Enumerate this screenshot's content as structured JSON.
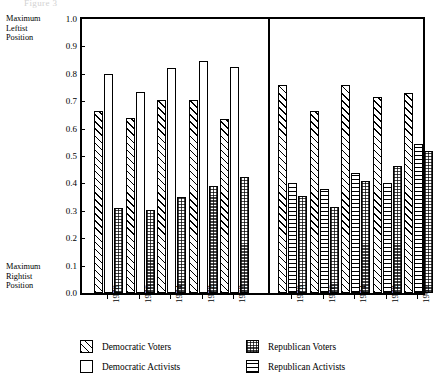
{
  "ghost_caption": "Figure 3",
  "axis": {
    "y_ticks": [
      "1.0",
      "0.9",
      "0.8",
      "0.7",
      "0.6",
      "0.5",
      "0.4",
      "0.3",
      "0.2",
      "0.1",
      "0.0"
    ],
    "y_values": [
      1.0,
      0.9,
      0.8,
      0.7,
      0.6,
      0.5,
      0.4,
      0.3,
      0.2,
      0.1,
      0.0
    ],
    "ylim": [
      0.0,
      1.0
    ],
    "top_note_lines": [
      "Maximum",
      "Leftist",
      "Position"
    ],
    "bottom_note_lines": [
      "Maximum",
      "Rightist",
      "Position"
    ]
  },
  "panels": [
    {
      "title": "Democratic  Ideological  Space"
    },
    {
      "title": "Republican  Ideological  Space"
    }
  ],
  "legend": [
    {
      "label": "Democratic Voters",
      "pattern": "diagonal-hatch"
    },
    {
      "label": "Democratic Activists",
      "pattern": "open-white"
    },
    {
      "label": "Republican Voters",
      "pattern": "checkered"
    },
    {
      "label": "Republican Activists",
      "pattern": "horizontal-lines"
    }
  ],
  "chart_data": {
    "type": "bar",
    "title": "",
    "xlabel": "",
    "ylabel": "Maximum Leftist Position (1.0) to Maximum Rightist Position (0.0)",
    "ylim": [
      0.0,
      1.0
    ],
    "grid": false,
    "legend_position": "bottom",
    "categories": [
      "1978",
      "1976",
      "1974",
      "1972",
      "1969",
      "1978",
      "1976",
      "1974",
      "1972",
      "1969"
    ],
    "panel_groups": [
      {
        "panel": "Democratic  Ideological  Space",
        "categories": [
          "1978",
          "1976",
          "1974",
          "1972",
          "1969"
        ],
        "series": [
          {
            "name": "Democratic Voters",
            "pattern": "diagonal-hatch",
            "values": [
              0.665,
              0.64,
              0.705,
              0.703,
              0.635
            ]
          },
          {
            "name": "Democratic Activists",
            "pattern": "open-white",
            "values": [
              0.8,
              0.733,
              0.82,
              0.848,
              0.825
            ]
          },
          {
            "name": "Republican Voters",
            "pattern": "checkered",
            "values": [
              0.312,
              0.303,
              0.352,
              0.39,
              0.425
            ]
          }
        ]
      },
      {
        "panel": "Republican  Ideological  Space",
        "categories": [
          "1978",
          "1976",
          "1974",
          "1972",
          "1969"
        ],
        "series": [
          {
            "name": "Democratic Voters",
            "pattern": "diagonal-hatch",
            "values": [
              0.76,
              0.665,
              0.76,
              0.715,
              0.73
            ]
          },
          {
            "name": "Republican Activists",
            "pattern": "horizontal-lines",
            "values": [
              0.4,
              0.38,
              0.437,
              0.4,
              0.545
            ]
          },
          {
            "name": "Republican Voters",
            "pattern": "checkered",
            "values": [
              0.355,
              0.313,
              0.408,
              0.462,
              0.52
            ]
          }
        ]
      }
    ]
  }
}
